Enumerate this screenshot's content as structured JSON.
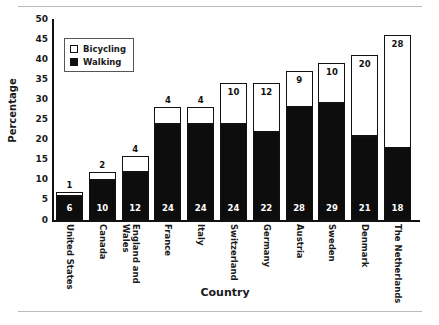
{
  "chart_data": {
    "type": "bar",
    "subtype": "stacked-vertical",
    "title": "",
    "xlabel": "Country",
    "ylabel": "Percentage",
    "ylim": [
      0,
      50
    ],
    "ytick_step": 5,
    "yticks": [
      "50",
      "45",
      "40",
      "35",
      "30",
      "25",
      "20",
      "15",
      "10",
      "5",
      "0"
    ],
    "grid": false,
    "legend_position": "upper-left-inside",
    "categories": [
      "United States",
      "Canada",
      "England and\nWales",
      "France",
      "Italy",
      "Switzerland",
      "Germany",
      "Austria",
      "Sweden",
      "Denmark",
      "The Netherlands"
    ],
    "series": [
      {
        "name": "Walking",
        "color": "#0d0d0d",
        "values": [
          6,
          10,
          12,
          24,
          24,
          24,
          22,
          28,
          29,
          21,
          18
        ]
      },
      {
        "name": "Bicycling",
        "color": "#ffffff",
        "values": [
          1,
          2,
          4,
          4,
          4,
          10,
          12,
          9,
          10,
          20,
          28
        ]
      }
    ],
    "totals": [
      7,
      12,
      16,
      28,
      28,
      34,
      34,
      37,
      39,
      41,
      46
    ]
  },
  "legend": {
    "items": [
      {
        "label": "Bicycling",
        "swatch": "white-square"
      },
      {
        "label": "Walking",
        "swatch": "black-square"
      }
    ]
  },
  "axis_titles": {
    "y": "Percentage",
    "x": "Country"
  }
}
